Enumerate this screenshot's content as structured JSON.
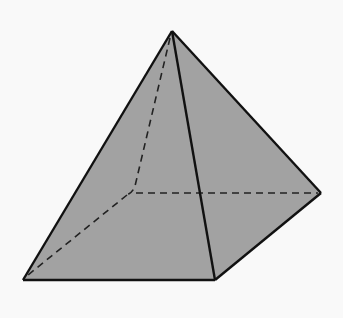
{
  "diagram": {
    "kind": "3D solid wireframe",
    "colors": {
      "background": "#f9f9f9",
      "face_fill": "#a2a2a2",
      "edge": "#111111"
    },
    "vertices": {
      "apex": [
        172,
        31
      ],
      "front_left": [
        23,
        280
      ],
      "front_right": [
        215,
        280
      ],
      "back_right": [
        321,
        193
      ],
      "back_left_hidden": [
        131,
        193
      ]
    },
    "visible_edges": [
      [
        "apex",
        "front_left"
      ],
      [
        "apex",
        "front_right"
      ],
      [
        "apex",
        "back_right"
      ],
      [
        "front_left",
        "front_right"
      ],
      [
        "front_right",
        "back_right"
      ]
    ],
    "hidden_edges": [
      [
        "apex",
        "back_left_hidden"
      ],
      [
        "back_left_hidden",
        "front_left"
      ],
      [
        "back_left_hidden",
        "back_right"
      ]
    ]
  }
}
